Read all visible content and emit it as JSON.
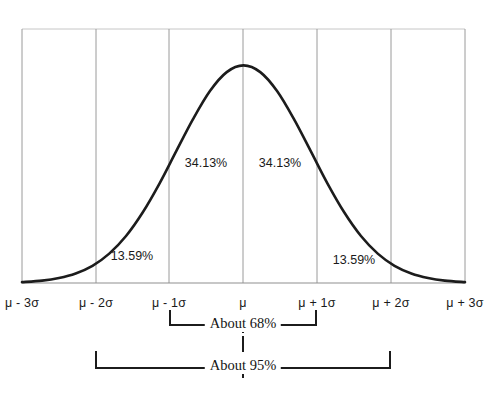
{
  "chart_data": {
    "type": "line",
    "title": "",
    "subtitle": "",
    "xlabel": "",
    "ylabel": "",
    "grid": true,
    "legend_position": "none",
    "x_tick_labels": [
      "μ - 3σ",
      "μ - 2σ",
      "μ - 1σ",
      "μ",
      "μ + 1σ",
      "μ + 2σ",
      "μ + 3σ"
    ],
    "x_tick_values": [
      -3,
      -2,
      -1,
      0,
      1,
      2,
      3
    ],
    "xlim": [
      -3.3,
      3.3
    ],
    "ylim": [
      0,
      1.08
    ],
    "series": [
      {
        "name": "normal-distribution-curve",
        "x": [
          -3.3,
          -3.0,
          -2.75,
          -2.5,
          -2.25,
          -2.0,
          -1.75,
          -1.5,
          -1.25,
          -1.0,
          -0.75,
          -0.5,
          -0.25,
          0.0,
          0.25,
          0.5,
          0.75,
          1.0,
          1.25,
          1.5,
          1.75,
          2.0,
          2.25,
          2.5,
          2.75,
          3.0,
          3.3
        ],
        "y": [
          0.004,
          0.011,
          0.023,
          0.044,
          0.079,
          0.135,
          0.216,
          0.325,
          0.458,
          0.607,
          0.754,
          0.882,
          0.969,
          1.0,
          0.969,
          0.882,
          0.754,
          0.607,
          0.458,
          0.325,
          0.216,
          0.135,
          0.079,
          0.044,
          0.023,
          0.011,
          0.004
        ]
      }
    ],
    "region_labels": [
      {
        "name": "minus-two-to-minus-one-sigma",
        "text": "13.59%",
        "x_center": -1.5,
        "y_position": 0.09
      },
      {
        "name": "minus-one-to-mean-sigma",
        "text": "34.13%",
        "x_center": -0.5,
        "y_position": 0.53
      },
      {
        "name": "mean-to-plus-one-sigma",
        "text": "34.13%",
        "x_center": 0.5,
        "y_position": 0.53
      },
      {
        "name": "plus-one-to-plus-two-sigma",
        "text": "13.59%",
        "x_center": 1.5,
        "y_position": 0.09
      }
    ],
    "brackets": [
      {
        "name": "about-68-bracket",
        "label": "About 68%",
        "from": -1,
        "to": 1
      },
      {
        "name": "about-95-bracket",
        "label": "About 95%",
        "from": -2,
        "to": 2
      }
    ],
    "colors": {
      "curve": "#1c1c1c",
      "gridline": "#9a9a9a",
      "baseline": "#8f8f8f",
      "bracket": "#1c1c1c",
      "text": "#1a1a1a",
      "background": "#ffffff"
    }
  }
}
